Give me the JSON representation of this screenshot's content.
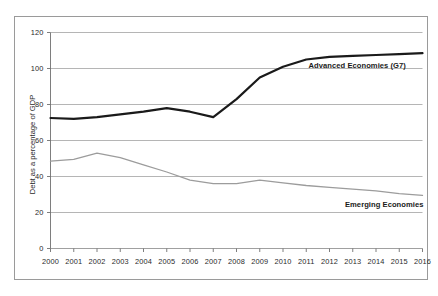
{
  "chart_data": {
    "type": "line",
    "title": "",
    "xlabel": "",
    "ylabel": "Debt as a percentage of GDP",
    "x": [
      2000,
      2001,
      2002,
      2003,
      2004,
      2005,
      2006,
      2007,
      2008,
      2009,
      2010,
      2011,
      2012,
      2013,
      2014,
      2015,
      2016
    ],
    "xticklabels": [
      "2000",
      "2001",
      "2002",
      "2003",
      "2004",
      "2005",
      "2006",
      "2007",
      "2008",
      "2009",
      "2010",
      "2011",
      "2012",
      "2013",
      "2014",
      "2015",
      "2016"
    ],
    "yticklabels": [
      "0",
      "20",
      "40",
      "60",
      "80",
      "100",
      "120"
    ],
    "yticks": [
      0,
      20,
      40,
      60,
      80,
      100,
      120
    ],
    "ylim": [
      0,
      120
    ],
    "xlim": [
      2000,
      2016
    ],
    "grid": "horizontal",
    "legend_position": "inline-annotations",
    "series": [
      {
        "name": "Advanced Economies (G7)",
        "color": "#1a1a1a",
        "linewidth": 2.2,
        "label_x": 2011.1,
        "label_y": 101.5,
        "values": [
          72.5,
          72.0,
          73.0,
          74.5,
          76.0,
          78.0,
          76.0,
          73.0,
          83.0,
          95.0,
          101.0,
          105.0,
          106.5,
          107.0,
          107.5,
          108.0,
          108.5
        ]
      },
      {
        "name": "Emerging Economies",
        "color": "#9c9c9c",
        "linewidth": 1.3,
        "label_x": 2013.0,
        "label_y": 24.0,
        "values": [
          48.5,
          49.5,
          53.0,
          50.5,
          46.5,
          42.5,
          38.0,
          36.0,
          36.0,
          38.0,
          36.5,
          35.0,
          34.0,
          33.0,
          32.0,
          30.5,
          29.5
        ]
      }
    ]
  }
}
